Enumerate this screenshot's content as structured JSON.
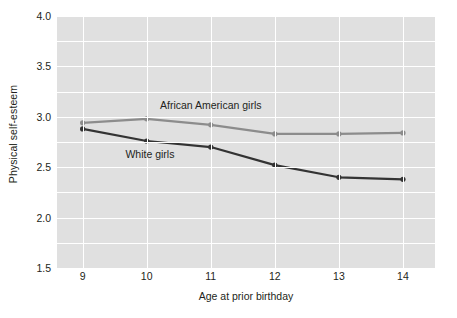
{
  "chart_data": {
    "type": "line",
    "title": "",
    "xlabel": "Age at prior birthday",
    "ylabel": "Physical self-esteem",
    "x": [
      9,
      10,
      11,
      12,
      13,
      14
    ],
    "categories": [
      "9",
      "10",
      "11",
      "12",
      "13",
      "14"
    ],
    "xtick_labels": [
      "9",
      "10",
      "11",
      "12",
      "13",
      "14"
    ],
    "ytick_labels": [
      "4.0",
      "3.5",
      "3.0",
      "2.5",
      "2.0",
      "1.5"
    ],
    "ytick_values": [
      4.0,
      3.5,
      3.0,
      2.5,
      2.0,
      1.5
    ],
    "xlim": [
      8.6,
      14.5
    ],
    "ylim": [
      1.5,
      4.0
    ],
    "grid": true,
    "grid_minor_step": 0.25,
    "legend_position": "inline-annotation",
    "plot_background": "#e0e0e0",
    "grid_color": "#ffffff",
    "series": [
      {
        "name": "African American girls",
        "color": "#8c8c8c",
        "marker": "circle",
        "values": [
          2.94,
          2.98,
          2.92,
          2.83,
          2.83,
          2.84
        ],
        "label_x": 11.0,
        "label_y": 3.12
      },
      {
        "name": "White girls",
        "color": "#333333",
        "marker": "circle",
        "values": [
          2.88,
          2.76,
          2.7,
          2.52,
          2.4,
          2.38
        ],
        "label_x": 10.05,
        "label_y": 2.63
      }
    ]
  }
}
